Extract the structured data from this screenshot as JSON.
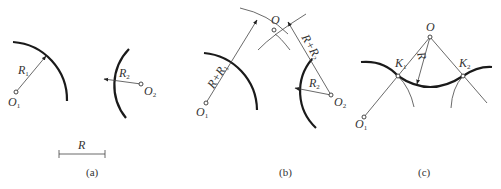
{
  "panels": [
    {
      "caption": "(a)",
      "labels": {
        "r1": "R",
        "r1_sub": "1",
        "o1": "O",
        "o1_sub": "1",
        "r2": "R",
        "r2_sub": "2",
        "o2": "O",
        "o2_sub": "2",
        "r": "R"
      }
    },
    {
      "caption": "(b)",
      "labels": {
        "o": "O",
        "rr1": "R+R",
        "rr1_sub": "1",
        "rr2": "R+R",
        "rr2_sub": "2",
        "r2": "R",
        "r2_sub": "2",
        "o1": "O",
        "o1_sub": "1",
        "o2": "O",
        "o2_sub": "2"
      }
    },
    {
      "caption": "(c)",
      "labels": {
        "o": "O",
        "k1": "K",
        "k1_sub": "1",
        "k2": "K",
        "k2_sub": "2",
        "r": "R",
        "o1": "O",
        "o1_sub": "1"
      }
    }
  ]
}
